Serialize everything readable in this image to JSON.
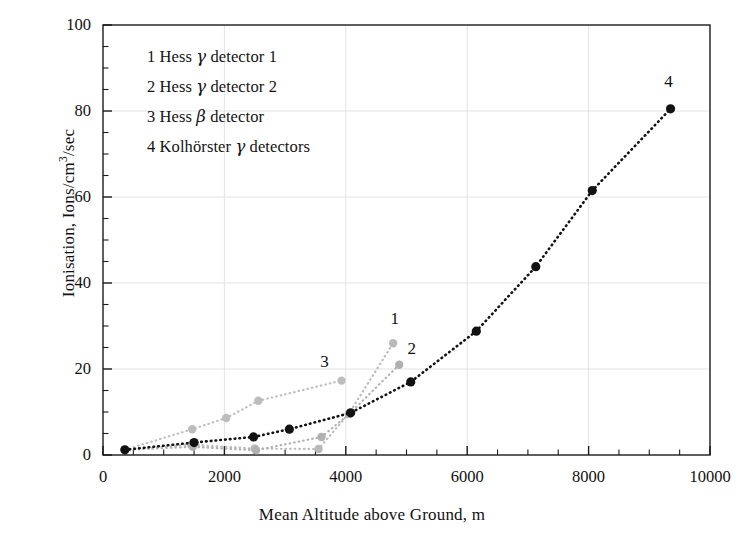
{
  "chart_data": {
    "type": "line",
    "title": "",
    "xlabel": "Mean Altitude above Ground, m",
    "ylabel": "Ionisation, Ions/cm³/sec",
    "xlim": [
      0,
      10000
    ],
    "ylim": [
      0,
      100
    ],
    "xticks": [
      0,
      2000,
      4000,
      6000,
      8000,
      10000
    ],
    "xtick_labels": [
      "0",
      "2000",
      "4000",
      "6000",
      "8000",
      "10000"
    ],
    "yticks": [
      0,
      20,
      40,
      60,
      80,
      100
    ],
    "ytick_labels": [
      "0",
      "20",
      "40",
      "60",
      "80",
      "100"
    ],
    "x_minor_step": 500,
    "y_minor_step": 5,
    "grid": "major gridlines, light grey, both axes",
    "legend_position": "upper-left inside axes",
    "line_style": "dotted",
    "marker": "filled circle",
    "series": [
      {
        "name": "Hess γ detector 1",
        "tag": "1",
        "color": "#b9b9b9",
        "tag_x": 4820,
        "tag_y": 31.5,
        "points": [
          {
            "x": 360,
            "y": 1.2
          },
          {
            "x": 1450,
            "y": 2.4
          },
          {
            "x": 2500,
            "y": 1.5
          },
          {
            "x": 3550,
            "y": 1.4
          },
          {
            "x": 4050,
            "y": 9.6
          },
          {
            "x": 4780,
            "y": 26.0
          }
        ]
      },
      {
        "name": "Hess γ detector 2",
        "tag": "2",
        "color": "#b0b0b0",
        "tag_x": 5100,
        "tag_y": 24.5,
        "points": [
          {
            "x": 360,
            "y": 1.2
          },
          {
            "x": 1480,
            "y": 1.9
          },
          {
            "x": 2520,
            "y": 1.1
          },
          {
            "x": 3600,
            "y": 4.2
          },
          {
            "x": 4060,
            "y": 9.6
          },
          {
            "x": 4880,
            "y": 21.0
          }
        ]
      },
      {
        "name": "Hess β detector",
        "tag": "3",
        "color": "#bdbdbd",
        "tag_x": 3660,
        "tag_y": 21.5,
        "points": [
          {
            "x": 360,
            "y": 1.2
          },
          {
            "x": 1470,
            "y": 6.0
          },
          {
            "x": 2030,
            "y": 8.6
          },
          {
            "x": 2560,
            "y": 12.6
          },
          {
            "x": 3930,
            "y": 17.3
          }
        ]
      },
      {
        "name": "Kolhörster γ detectors",
        "tag": "4",
        "color": "#121212",
        "tag_x": 9330,
        "tag_y": 86.5,
        "points": [
          {
            "x": 360,
            "y": 1.2
          },
          {
            "x": 1500,
            "y": 2.9
          },
          {
            "x": 2480,
            "y": 4.2
          },
          {
            "x": 3070,
            "y": 6.0
          },
          {
            "x": 4080,
            "y": 9.8
          },
          {
            "x": 5070,
            "y": 17.0
          },
          {
            "x": 6150,
            "y": 28.8
          },
          {
            "x": 7130,
            "y": 43.8
          },
          {
            "x": 8060,
            "y": 61.5
          },
          {
            "x": 9350,
            "y": 80.5
          }
        ]
      }
    ]
  },
  "legend": {
    "entries": [
      {
        "index": "1",
        "prefix": "1 Hess ",
        "greek": "γ",
        "suffix": " detector 1"
      },
      {
        "index": "2",
        "prefix": "2 Hess ",
        "greek": "γ",
        "suffix": " detector 2"
      },
      {
        "index": "3",
        "prefix": "3 Hess ",
        "greek": "β",
        "suffix": " detector"
      },
      {
        "index": "4",
        "prefix": "4 Kolhörster ",
        "greek": "γ",
        "suffix": " detectors"
      }
    ]
  },
  "colors": {
    "axis": "#1b1b1b",
    "grid": "#e3e3e3",
    "dark_series": "#121212",
    "grey_series": "#b9b9b9",
    "background": "#ffffff"
  }
}
